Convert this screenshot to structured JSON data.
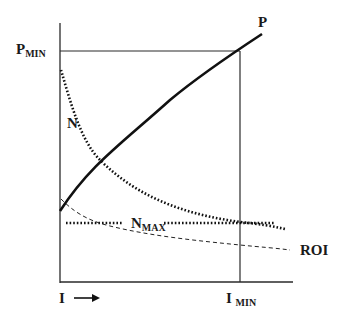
{
  "diagram": {
    "labels": {
      "p_min_main": "P",
      "p_min_sub": "MIN",
      "p_curve": "P",
      "n_curve": "N",
      "n_max_main": "N",
      "n_max_sub": "MAX",
      "roi_curve": "ROI",
      "x_axis_main": "I",
      "x_axis_arrow": "→",
      "i_min_main": "I",
      "i_min_sub": "MIN"
    },
    "curves": [
      {
        "name": "P",
        "style": "solid-thick",
        "description": "increasing concave curve"
      },
      {
        "name": "N",
        "style": "dotted",
        "description": "decreasing convex curve"
      },
      {
        "name": "N_MAX",
        "style": "dotted",
        "description": "horizontal constant level"
      },
      {
        "name": "ROI",
        "style": "dashed-thin",
        "description": "decreasing curve"
      }
    ],
    "reference_lines": [
      "P_MIN horizontal",
      "I_MIN vertical"
    ],
    "colors": {
      "ink": "#1a1a1a",
      "background": "#ffffff"
    }
  }
}
